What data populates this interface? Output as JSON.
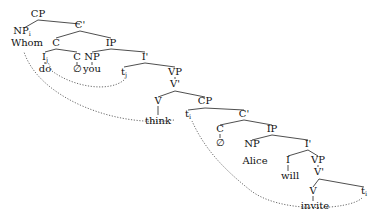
{
  "diagram": {
    "type": "syntax-tree",
    "nodes": [
      {
        "id": "cp1",
        "label": "CP",
        "x": 38,
        "y": 17
      },
      {
        "id": "np_i",
        "label": "NP",
        "sub": "i",
        "x": 22,
        "y": 34
      },
      {
        "id": "cbar1",
        "label": "C'",
        "x": 80,
        "y": 28
      },
      {
        "id": "whom",
        "label": "Whom",
        "x": 27,
        "y": 46
      },
      {
        "id": "c1",
        "label": "C",
        "x": 56,
        "y": 46
      },
      {
        "id": "ip1",
        "label": "IP",
        "x": 111,
        "y": 46
      },
      {
        "id": "i_j",
        "label": "I",
        "sub": "j",
        "x": 45,
        "y": 60
      },
      {
        "id": "c2",
        "label": "C",
        "x": 77,
        "y": 60
      },
      {
        "id": "do",
        "label": "do",
        "x": 45,
        "y": 72
      },
      {
        "id": "null1",
        "label": "∅",
        "x": 77,
        "y": 72
      },
      {
        "id": "np1",
        "label": "NP",
        "x": 92,
        "y": 60
      },
      {
        "id": "you",
        "label": "you",
        "x": 92,
        "y": 72
      },
      {
        "id": "ibar1",
        "label": "I'",
        "x": 145,
        "y": 60
      },
      {
        "id": "t_j",
        "label": "t",
        "sub": "j",
        "x": 124,
        "y": 75
      },
      {
        "id": "vp1",
        "label": "VP",
        "x": 175,
        "y": 75
      },
      {
        "id": "vbar1",
        "label": "V'",
        "x": 175,
        "y": 87
      },
      {
        "id": "v1",
        "label": "V",
        "x": 158,
        "y": 104
      },
      {
        "id": "cp2",
        "label": "CP",
        "x": 205,
        "y": 104
      },
      {
        "id": "think",
        "label": "think",
        "x": 158,
        "y": 124
      },
      {
        "id": "t_i1",
        "label": "t",
        "sub": "i",
        "x": 188,
        "y": 117
      },
      {
        "id": "cbar2",
        "label": "C'",
        "x": 244,
        "y": 117
      },
      {
        "id": "c3",
        "label": "C",
        "x": 220,
        "y": 132
      },
      {
        "id": "null2",
        "label": "∅",
        "x": 220,
        "y": 146
      },
      {
        "id": "ip2",
        "label": "IP",
        "x": 272,
        "y": 132
      },
      {
        "id": "np2",
        "label": "NP",
        "x": 252,
        "y": 147
      },
      {
        "id": "alice",
        "label": "Alice",
        "x": 255,
        "y": 164
      },
      {
        "id": "ibar2",
        "label": "I'",
        "x": 308,
        "y": 147
      },
      {
        "id": "i2",
        "label": "I",
        "x": 288,
        "y": 163
      },
      {
        "id": "will",
        "label": "will",
        "x": 290,
        "y": 179
      },
      {
        "id": "vp2",
        "label": "VP",
        "x": 318,
        "y": 163
      },
      {
        "id": "vbar2",
        "label": "V'",
        "x": 319,
        "y": 175
      },
      {
        "id": "v2",
        "label": "V",
        "x": 313,
        "y": 194
      },
      {
        "id": "invite",
        "label": "invite",
        "x": 315,
        "y": 209
      },
      {
        "id": "t_i2",
        "label": "t",
        "sub": "i",
        "x": 364,
        "y": 194
      }
    ],
    "branches": [
      [
        24,
        28,
        38,
        20
      ],
      [
        38,
        20,
        80,
        24
      ],
      [
        56,
        38,
        80,
        31
      ],
      [
        80,
        31,
        111,
        38
      ],
      [
        45,
        52,
        56,
        49
      ],
      [
        56,
        49,
        77,
        52
      ],
      [
        92,
        52,
        111,
        49
      ],
      [
        111,
        49,
        145,
        52
      ],
      [
        124,
        67,
        145,
        63
      ],
      [
        145,
        63,
        175,
        67
      ],
      [
        158,
        97,
        175,
        91
      ],
      [
        175,
        91,
        205,
        97
      ],
      [
        188,
        110,
        205,
        108
      ],
      [
        205,
        108,
        244,
        110
      ],
      [
        220,
        125,
        244,
        120
      ],
      [
        244,
        120,
        272,
        125
      ],
      [
        252,
        140,
        272,
        135
      ],
      [
        272,
        135,
        308,
        140
      ],
      [
        288,
        156,
        308,
        150
      ],
      [
        308,
        150,
        318,
        156
      ],
      [
        313,
        187,
        319,
        179
      ],
      [
        319,
        179,
        364,
        187
      ]
    ],
    "unary": [
      [
        45,
        62,
        45,
        64
      ],
      [
        77,
        62,
        77,
        65
      ],
      [
        92,
        62,
        92,
        65
      ],
      [
        175,
        77,
        175,
        79
      ],
      [
        158,
        106,
        158,
        115
      ],
      [
        220,
        134,
        220,
        138
      ],
      [
        288,
        165,
        288,
        171
      ],
      [
        318,
        165,
        318,
        167
      ],
      [
        313,
        196,
        313,
        201
      ]
    ],
    "movement_arrows": [
      {
        "from": "t_j",
        "to": "i_j",
        "path": "M124,80 C110,92 75,88 52,71 L48,62"
      },
      {
        "from": "t_i (intermediate)",
        "to": "Whom",
        "path": "M174,120 C120,128 40,100 24,52"
      },
      {
        "from": "t_i (base)",
        "to": "t_i (intermediate)",
        "path": "M362,198 C350,210 280,214 250,190 C225,170 205,150 192,121"
      }
    ]
  }
}
